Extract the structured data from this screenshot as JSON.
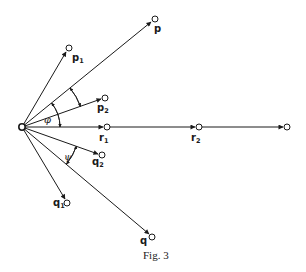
{
  "figure": {
    "caption": "Fig. 3",
    "origin": {
      "x": 22,
      "y": 127
    },
    "vectors": [
      {
        "id": "p1",
        "label": "p",
        "sub": "1",
        "end": {
          "x": 69,
          "y": 48
        },
        "label_pos": {
          "x": 72,
          "y": 61
        }
      },
      {
        "id": "p",
        "label": "p",
        "sub": "",
        "end": {
          "x": 155,
          "y": 19
        },
        "label_pos": {
          "x": 154,
          "y": 32
        }
      },
      {
        "id": "p2",
        "label": "p",
        "sub": "2",
        "end": {
          "x": 105,
          "y": 98
        },
        "label_pos": {
          "x": 97,
          "y": 111
        }
      },
      {
        "id": "r1",
        "label": "r",
        "sub": "1",
        "end": {
          "x": 107,
          "y": 127
        },
        "label_pos": {
          "x": 99,
          "y": 141
        }
      },
      {
        "id": "r2",
        "label": "r",
        "sub": "2",
        "end": {
          "x": 199,
          "y": 127
        },
        "label_pos": {
          "x": 191,
          "y": 141
        }
      },
      {
        "id": "r3",
        "label": "",
        "sub": "",
        "end": {
          "x": 287,
          "y": 127
        }
      },
      {
        "id": "q2",
        "label": "q",
        "sub": "2",
        "end": {
          "x": 102,
          "y": 155
        },
        "label_pos": {
          "x": 94,
          "y": 165
        }
      },
      {
        "id": "q1",
        "label": "q",
        "sub": "1",
        "end": {
          "x": 67,
          "y": 203
        },
        "label_pos": {
          "x": 53,
          "y": 206
        }
      },
      {
        "id": "q",
        "label": "q",
        "sub": "",
        "end": {
          "x": 152,
          "y": 237
        },
        "label_pos": {
          "x": 140,
          "y": 244
        }
      }
    ],
    "angles": [
      {
        "symbol": "φ",
        "between": [
          "p",
          "r1"
        ],
        "pos": {
          "x": 45,
          "y": 122
        }
      },
      {
        "symbol": "ψ",
        "between": [
          "q2",
          "q"
        ],
        "pos": {
          "x": 66,
          "y": 158
        }
      }
    ]
  }
}
